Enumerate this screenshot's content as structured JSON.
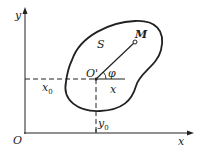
{
  "diagram": {
    "type": "rigid-body-planar-coordinates",
    "axes": {
      "x_label": "x",
      "y_label": "y",
      "origin_label": "O"
    },
    "body": {
      "label": "S",
      "reference_point": "O'",
      "point": "M",
      "angle": "φ",
      "local_axis": "x"
    },
    "coordinates": {
      "x0": "x",
      "x0_sub": "0",
      "y0": "y",
      "y0_sub": "0"
    },
    "colors": {
      "stroke": "#222222",
      "background": "#ffffff"
    }
  }
}
